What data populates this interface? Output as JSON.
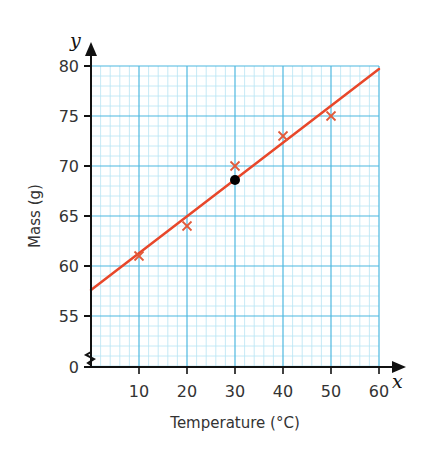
{
  "chart_data": {
    "type": "scatter",
    "title": "",
    "xlabel": "Temperature (°C)",
    "ylabel": "Mass (g)",
    "x_axis_variable": "x",
    "y_axis_variable": "y",
    "xlim": [
      0,
      60
    ],
    "ylim": [
      55,
      80
    ],
    "y_axis_break": true,
    "y_axis_break_origin_label": "0",
    "x_ticks": [
      10,
      20,
      30,
      40,
      50,
      60
    ],
    "y_ticks": [
      0,
      55,
      60,
      65,
      70,
      75,
      80
    ],
    "grid": true,
    "series": [
      {
        "name": "measurements",
        "marker": "x",
        "color": "#e05a3a",
        "points": [
          {
            "x": 10,
            "y": 61
          },
          {
            "x": 20,
            "y": 64
          },
          {
            "x": 30,
            "y": 70
          },
          {
            "x": 40,
            "y": 73
          },
          {
            "x": 50,
            "y": 75
          }
        ]
      },
      {
        "name": "mean point",
        "marker": "dot",
        "color": "#000000",
        "points": [
          {
            "x": 30,
            "y": 68.6
          }
        ]
      },
      {
        "name": "line of best fit",
        "type": "line",
        "color": "#e8472a",
        "points": [
          {
            "x": 0,
            "y": 57.6
          },
          {
            "x": 60,
            "y": 79.7
          }
        ]
      }
    ]
  },
  "colors": {
    "grid_major": "#4db8e0",
    "grid_minor": "#b8e4f4",
    "axis": "#111111",
    "fit_line": "#e8472a",
    "marker": "#e05a3a"
  }
}
